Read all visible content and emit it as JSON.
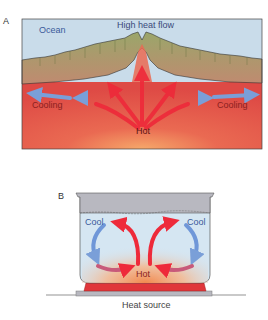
{
  "panel_a": {
    "letter": "A",
    "labels": {
      "ocean": "Ocean",
      "high_heat_flow": "High heat flow",
      "cooling_left": "Cooling",
      "cooling_right": "Cooling",
      "hot": "Hot"
    }
  },
  "panel_b": {
    "letter": "B",
    "labels": {
      "cool_left": "Cool",
      "cool_right": "Cool",
      "hot": "Hot",
      "heat_source": "Heat source"
    }
  },
  "colors": {
    "ocean": "#c9dcea",
    "crust": "#9aa66e",
    "mantle": "#e4514a",
    "hot_arrow": "#ee2a3a",
    "cool_arrow": "#6f97d8",
    "label_dark_red": "#8a1f1f",
    "label_blue": "#3a5a9a",
    "pot_water": "#d5e6f2",
    "pot_rim": "#b8b8c0",
    "burner": "#e0363a"
  }
}
